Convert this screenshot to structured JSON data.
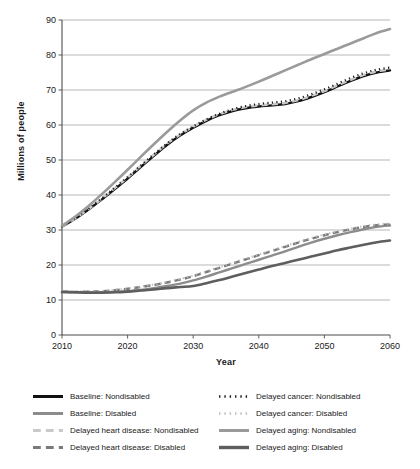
{
  "chart_data": {
    "type": "line",
    "title": "",
    "xlabel": "Year",
    "ylabel": "Millions of people",
    "xlim": [
      2010,
      2060
    ],
    "ylim": [
      0,
      90
    ],
    "ytick_step": 10,
    "xtick_step": 10,
    "grid": true,
    "legend_position": "bottom",
    "xticks": [
      "2010",
      "2020",
      "2030",
      "2040",
      "2050",
      "2060"
    ],
    "yticks": [
      "0",
      "10",
      "20",
      "30",
      "40",
      "50",
      "60",
      "70",
      "80",
      "90"
    ],
    "x": [
      2010,
      2012,
      2014,
      2016,
      2018,
      2020,
      2022,
      2024,
      2026,
      2028,
      2030,
      2032,
      2034,
      2036,
      2038,
      2040,
      2042,
      2044,
      2046,
      2048,
      2050,
      2052,
      2054,
      2056,
      2058,
      2060
    ],
    "series": [
      {
        "name": "Baseline: Nondisabled",
        "color": "#111111",
        "style": "solid",
        "width": 2.4,
        "values": [
          31.0,
          33.2,
          35.8,
          38.6,
          41.6,
          44.7,
          48.0,
          51.2,
          54.3,
          57.0,
          59.2,
          61.2,
          62.8,
          64.0,
          64.8,
          65.3,
          65.6,
          66.0,
          66.8,
          68.0,
          69.4,
          71.0,
          72.6,
          74.0,
          75.0,
          75.6
        ]
      },
      {
        "name": "Baseline: Disabled",
        "color": "#8c8c8c",
        "style": "solid",
        "width": 2.4,
        "values": [
          12.3,
          12.2,
          12.2,
          12.2,
          12.3,
          12.5,
          12.9,
          13.4,
          14.0,
          14.7,
          15.6,
          16.7,
          17.9,
          19.1,
          20.3,
          21.5,
          22.7,
          23.9,
          25.2,
          26.4,
          27.5,
          28.5,
          29.4,
          30.2,
          30.9,
          31.3
        ]
      },
      {
        "name": "Delayed heart disease: Nondisabled",
        "color": "#c9c9c9",
        "style": "dashed",
        "width": 2.4,
        "values": [
          31.0,
          33.3,
          35.9,
          38.8,
          41.9,
          45.0,
          48.3,
          51.5,
          54.6,
          57.3,
          59.5,
          61.5,
          63.1,
          64.3,
          65.1,
          65.6,
          65.9,
          66.3,
          67.1,
          68.3,
          69.7,
          71.3,
          72.9,
          74.3,
          75.3,
          75.9
        ]
      },
      {
        "name": "Delayed heart disease: Disabled",
        "color": "#7a7a7a",
        "style": "dashed",
        "width": 2.4,
        "values": [
          12.4,
          12.3,
          12.4,
          12.5,
          12.8,
          13.2,
          13.7,
          14.3,
          15.0,
          15.8,
          16.8,
          18.0,
          19.2,
          20.4,
          21.6,
          22.8,
          24.0,
          25.2,
          26.4,
          27.5,
          28.5,
          29.4,
          30.2,
          30.9,
          31.4,
          31.6
        ]
      },
      {
        "name": "Delayed cancer: Nondisabled",
        "color": "#1f1f1f",
        "style": "dotted",
        "width": 2.2,
        "values": [
          31.1,
          33.4,
          36.0,
          38.9,
          42.0,
          45.1,
          48.4,
          51.6,
          54.7,
          57.4,
          59.6,
          61.6,
          63.2,
          64.5,
          65.4,
          66.0,
          66.4,
          66.8,
          67.6,
          68.8,
          70.2,
          71.8,
          73.4,
          74.8,
          75.8,
          76.4
        ]
      },
      {
        "name": "Delayed cancer: Disabled",
        "color": "#bdbdbd",
        "style": "dotted",
        "width": 2.2,
        "values": [
          12.5,
          12.4,
          12.5,
          12.6,
          12.9,
          13.3,
          13.8,
          14.4,
          15.1,
          16.0,
          17.0,
          18.2,
          19.4,
          20.6,
          21.8,
          23.0,
          24.2,
          25.4,
          26.6,
          27.7,
          28.7,
          29.6,
          30.4,
          31.1,
          31.6,
          31.8
        ]
      },
      {
        "name": "Delayed aging: Nondisabled",
        "color": "#9a9a9a",
        "style": "solid",
        "width": 2.6,
        "values": [
          31.2,
          33.8,
          36.8,
          40.1,
          43.6,
          47.2,
          50.9,
          54.5,
          58.0,
          61.3,
          64.2,
          66.4,
          68.1,
          69.5,
          70.9,
          72.4,
          74.0,
          75.6,
          77.2,
          78.8,
          80.3,
          81.8,
          83.3,
          84.8,
          86.3,
          87.4
        ]
      },
      {
        "name": "Delayed aging: Disabled",
        "color": "#5e5e5e",
        "style": "solid",
        "width": 2.6,
        "values": [
          12.3,
          12.2,
          12.1,
          12.1,
          12.2,
          12.4,
          12.7,
          13.0,
          13.4,
          13.7,
          14.0,
          14.8,
          15.7,
          16.7,
          17.7,
          18.7,
          19.7,
          20.6,
          21.5,
          22.4,
          23.3,
          24.2,
          25.0,
          25.8,
          26.5,
          27.0
        ]
      }
    ]
  },
  "legend": {
    "items": [
      {
        "label": "Baseline: Nondisabled",
        "color": "#111111",
        "style": "solid",
        "width": 3.0
      },
      {
        "label": "Delayed cancer: Nondisabled",
        "color": "#1f1f1f",
        "style": "dotted",
        "width": 2.6
      },
      {
        "label": "Baseline: Disabled",
        "color": "#8c8c8c",
        "style": "solid",
        "width": 3.0
      },
      {
        "label": "Delayed cancer: Disabled",
        "color": "#bdbdbd",
        "style": "dotted",
        "width": 2.6
      },
      {
        "label": "Delayed heart disease: Nondisabled",
        "color": "#c9c9c9",
        "style": "dashed",
        "width": 3.0
      },
      {
        "label": "Delayed aging: Nondisabled",
        "color": "#9a9a9a",
        "style": "solid",
        "width": 3.0
      },
      {
        "label": "Delayed heart disease: Disabled",
        "color": "#7a7a7a",
        "style": "dashed",
        "width": 3.0
      },
      {
        "label": "Delayed aging: Disabled",
        "color": "#5e5e5e",
        "style": "solid",
        "width": 3.4
      }
    ]
  },
  "style": {
    "grid_color": "#9a9a9a",
    "axis_color": "#4d4d4d",
    "tick_text_color": "#1a1a1a",
    "background": "#ffffff"
  }
}
